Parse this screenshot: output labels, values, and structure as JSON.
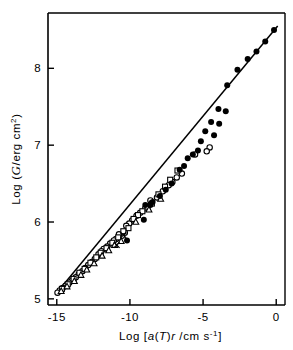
{
  "chart_data": {
    "type": "scatter",
    "title": "",
    "xlabel": "Log [a(T)r /cm s-1]",
    "ylabel": "Log (G/erg cm2)",
    "xlabel_parts": {
      "prefix": "Log  [",
      "italic_a": "a",
      "paren_open": "(",
      "italic_T": "T",
      "paren_close": ")",
      "italic_r": "r",
      "mid": " /cm  s",
      "superscript": "-1",
      "suffix": "]"
    },
    "ylabel_parts": {
      "prefix": "Log (",
      "script_symbol": "G",
      "mid": "/erg  cm",
      "superscript": "2",
      "suffix": ")"
    },
    "xlim": [
      -15.6,
      0.6
    ],
    "ylim": [
      4.92,
      8.72
    ],
    "xticks": [
      -15,
      -10,
      -5,
      0
    ],
    "xticklabels": [
      "-15",
      "-10",
      "-5",
      "0"
    ],
    "yticks": [
      5,
      6,
      7,
      8
    ],
    "yticklabels": [
      "5",
      "6",
      "7",
      "8"
    ],
    "grid": false,
    "legend": "none",
    "fit_line": {
      "label": "master curve fit",
      "x_start": -15.0,
      "y_start": 5.08,
      "x_end": 0.1,
      "y_end": 8.55
    },
    "series": [
      {
        "name": "filled-circle",
        "marker": "filled-circle",
        "color": "#000000",
        "points": [
          [
            -0.15,
            8.5
          ],
          [
            -0.75,
            8.35
          ],
          [
            -1.35,
            8.22
          ],
          [
            -1.95,
            8.12
          ],
          [
            -2.65,
            7.98
          ],
          [
            -3.35,
            7.78
          ],
          [
            -3.95,
            7.47
          ],
          [
            -3.45,
            7.44
          ],
          [
            -4.45,
            7.3
          ],
          [
            -3.9,
            7.28
          ],
          [
            -4.85,
            7.18
          ],
          [
            -4.25,
            7.13
          ],
          [
            -5.15,
            7.05
          ],
          [
            -5.35,
            6.93
          ],
          [
            -5.7,
            6.88
          ],
          [
            -6.05,
            6.83
          ],
          [
            -6.3,
            6.73
          ],
          [
            -6.6,
            6.68
          ],
          [
            -7.15,
            6.5
          ],
          [
            -7.55,
            6.42
          ],
          [
            -7.95,
            6.34
          ],
          [
            -8.45,
            6.26
          ],
          [
            -8.6,
            6.22
          ],
          [
            -8.95,
            6.22
          ],
          [
            -9.05,
            6.03
          ],
          [
            -10.2,
            5.76
          ]
        ]
      },
      {
        "name": "open-circle",
        "marker": "open-circle",
        "color": "#000000",
        "points": [
          [
            -4.55,
            6.97
          ],
          [
            -4.75,
            6.92
          ],
          [
            -5.55,
            6.88
          ],
          [
            -6.45,
            6.63
          ],
          [
            -6.8,
            6.58
          ],
          [
            -7.1,
            6.52
          ],
          [
            -7.35,
            6.48
          ],
          [
            -7.75,
            6.4
          ],
          [
            -8.15,
            6.32
          ],
          [
            -8.6,
            6.28
          ],
          [
            -8.95,
            6.18
          ],
          [
            -9.3,
            6.12
          ],
          [
            -9.55,
            6.08
          ],
          [
            -9.85,
            6.02
          ],
          [
            -10.05,
            5.98
          ],
          [
            -10.25,
            5.95
          ],
          [
            -10.35,
            5.86
          ],
          [
            -10.55,
            5.82
          ],
          [
            -10.75,
            5.84
          ],
          [
            -10.95,
            5.78
          ],
          [
            -11.1,
            5.76
          ],
          [
            -11.35,
            5.72
          ],
          [
            -11.55,
            5.68
          ],
          [
            -11.8,
            5.65
          ],
          [
            -11.95,
            5.62
          ],
          [
            -12.15,
            5.58
          ],
          [
            -12.4,
            5.52
          ],
          [
            -12.6,
            5.48
          ],
          [
            -12.85,
            5.44
          ],
          [
            -13.05,
            5.4
          ],
          [
            -13.25,
            5.36
          ],
          [
            -13.5,
            5.32
          ],
          [
            -13.7,
            5.28
          ],
          [
            -13.95,
            5.24
          ],
          [
            -14.15,
            5.21
          ],
          [
            -14.4,
            5.17
          ],
          [
            -14.6,
            5.14
          ],
          [
            -14.8,
            5.11
          ],
          [
            -14.95,
            5.08
          ]
        ]
      },
      {
        "name": "open-square",
        "marker": "open-square",
        "color": "#000000",
        "points": [
          [
            -6.75,
            6.67
          ],
          [
            -7.25,
            6.55
          ],
          [
            -7.6,
            6.46
          ],
          [
            -8.05,
            6.36
          ],
          [
            -8.5,
            6.24
          ],
          [
            -8.8,
            6.2
          ],
          [
            -9.15,
            6.14
          ],
          [
            -9.45,
            6.09
          ],
          [
            -9.75,
            6.04
          ],
          [
            -10.1,
            5.92
          ],
          [
            -10.45,
            5.88
          ],
          [
            -10.8,
            5.8
          ],
          [
            -11.2,
            5.73
          ],
          [
            -11.6,
            5.66
          ],
          [
            -12.0,
            5.6
          ],
          [
            -12.3,
            5.54
          ],
          [
            -12.7,
            5.47
          ],
          [
            -13.1,
            5.39
          ],
          [
            -13.45,
            5.34
          ],
          [
            -13.85,
            5.26
          ],
          [
            -14.25,
            5.19
          ],
          [
            -14.65,
            5.13
          ]
        ]
      },
      {
        "name": "open-triangle",
        "marker": "open-triangle",
        "color": "#000000",
        "points": [
          [
            -7.9,
            6.3
          ],
          [
            -8.7,
            6.16
          ],
          [
            -9.6,
            6.0
          ],
          [
            -10.6,
            5.75
          ],
          [
            -11.05,
            5.7
          ],
          [
            -11.45,
            5.63
          ],
          [
            -11.9,
            5.56
          ],
          [
            -12.45,
            5.46
          ],
          [
            -12.95,
            5.38
          ],
          [
            -13.35,
            5.31
          ],
          [
            -13.8,
            5.23
          ],
          [
            -14.3,
            5.16
          ],
          [
            -14.7,
            5.1
          ]
        ]
      },
      {
        "name": "cross",
        "marker": "cross",
        "color": "#000000",
        "points": [
          [
            -10.9,
            5.7
          ],
          [
            -10.45,
            5.83
          ]
        ]
      }
    ]
  }
}
